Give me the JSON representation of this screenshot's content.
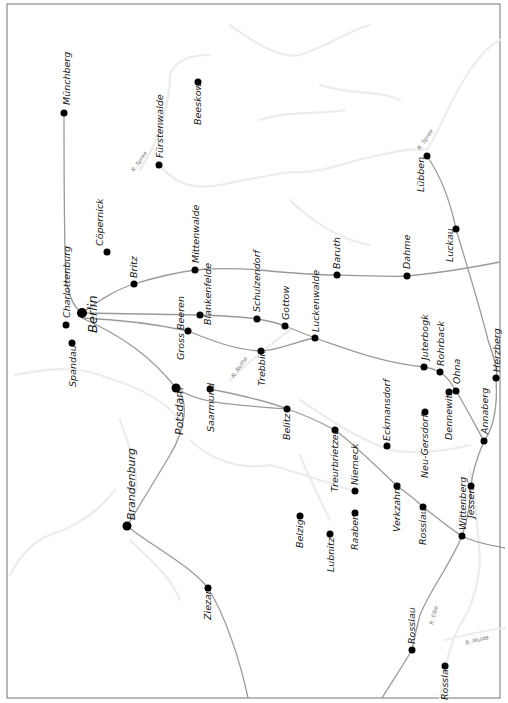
{
  "map": {
    "frame": {
      "x": 7,
      "y": 4,
      "w": 493,
      "h": 694
    },
    "colors": {
      "rail": "#9a9a9a",
      "town": "#000000",
      "river": "#ececec",
      "frame": "#8a8a8a",
      "label": "#1a1a1a"
    },
    "towns": [
      {
        "name": "Münchberg",
        "x": 64,
        "y": 113,
        "r": 3.5,
        "lx": 70,
        "ly": 105,
        "size": "normal"
      },
      {
        "name": "Beeskow",
        "x": 198,
        "y": 82,
        "r": 3.5,
        "lx": 201,
        "ly": 125,
        "size": "normal"
      },
      {
        "name": "Fürstenwalde",
        "x": 159,
        "y": 165,
        "r": 3.5,
        "lx": 163,
        "ly": 158,
        "size": "normal"
      },
      {
        "name": "Cöpernick",
        "x": 107,
        "y": 252,
        "r": 3.5,
        "lx": 103,
        "ly": 246,
        "size": "normal"
      },
      {
        "name": "Charlottenburg",
        "x": 66,
        "y": 325,
        "r": 3.5,
        "lx": 70,
        "ly": 318,
        "size": "normal"
      },
      {
        "name": "Spandau",
        "x": 72,
        "y": 343,
        "r": 3.5,
        "lx": 76,
        "ly": 387,
        "size": "normal"
      },
      {
        "name": "Berlin",
        "x": 82,
        "y": 313,
        "r": 5,
        "lx": 97,
        "ly": 333,
        "size": "big"
      },
      {
        "name": "Britz",
        "x": 134,
        "y": 284,
        "r": 3.5,
        "lx": 137,
        "ly": 278,
        "size": "normal"
      },
      {
        "name": "Mittenwalde",
        "x": 195,
        "y": 270,
        "r": 3.5,
        "lx": 199,
        "ly": 263,
        "size": "normal"
      },
      {
        "name": "Blankenfelde",
        "x": 200,
        "y": 315,
        "r": 3.5,
        "lx": 211,
        "ly": 325,
        "size": "normal"
      },
      {
        "name": "Gross Beeren",
        "x": 188,
        "y": 331,
        "r": 3.5,
        "lx": 184,
        "ly": 360,
        "size": "normal"
      },
      {
        "name": "Schulzendorf",
        "x": 257,
        "y": 319,
        "r": 3.5,
        "lx": 260,
        "ly": 312,
        "size": "normal"
      },
      {
        "name": "Gottow",
        "x": 285,
        "y": 326,
        "r": 3.5,
        "lx": 289,
        "ly": 320,
        "size": "normal"
      },
      {
        "name": "Luckenwalde",
        "x": 315,
        "y": 338,
        "r": 3.5,
        "lx": 319,
        "ly": 332,
        "size": "normal"
      },
      {
        "name": "Trebbin",
        "x": 261,
        "y": 351,
        "r": 3.5,
        "lx": 265,
        "ly": 386,
        "size": "normal"
      },
      {
        "name": "Baruth",
        "x": 337,
        "y": 275,
        "r": 3.5,
        "lx": 340,
        "ly": 269,
        "size": "normal"
      },
      {
        "name": "Dahme",
        "x": 407,
        "y": 276,
        "r": 3.5,
        "lx": 410,
        "ly": 269,
        "size": "normal"
      },
      {
        "name": "Lübben",
        "x": 427,
        "y": 156,
        "r": 3.5,
        "lx": 424,
        "ly": 192,
        "size": "normal"
      },
      {
        "name": "Luckau",
        "x": 456,
        "y": 229,
        "r": 3.5,
        "lx": 453,
        "ly": 262,
        "size": "normal"
      },
      {
        "name": "Potsdam",
        "x": 176,
        "y": 388,
        "r": 4.5,
        "lx": 183,
        "ly": 435,
        "size": "medium"
      },
      {
        "name": "Saarmund",
        "x": 210,
        "y": 389,
        "r": 3.5,
        "lx": 214,
        "ly": 432,
        "size": "normal"
      },
      {
        "name": "Belitz",
        "x": 287,
        "y": 409,
        "r": 3.5,
        "lx": 290,
        "ly": 440,
        "size": "normal"
      },
      {
        "name": "Juterbogk",
        "x": 424,
        "y": 367,
        "r": 3.5,
        "lx": 428,
        "ly": 360,
        "size": "normal"
      },
      {
        "name": "Rohrback",
        "x": 440,
        "y": 372,
        "r": 3.5,
        "lx": 444,
        "ly": 366,
        "size": "normal"
      },
      {
        "name": "Ohna",
        "x": 456,
        "y": 391,
        "r": 3.5,
        "lx": 460,
        "ly": 384,
        "size": "normal"
      },
      {
        "name": "Dennewitz",
        "x": 449,
        "y": 392,
        "r": 3.5,
        "lx": 452,
        "ly": 440,
        "size": "normal"
      },
      {
        "name": "Herzberg",
        "x": 496,
        "y": 378,
        "r": 3.5,
        "lx": 500,
        "ly": 372,
        "size": "normal"
      },
      {
        "name": "Neu-Gersdorf",
        "x": 425,
        "y": 412,
        "r": 3.5,
        "lx": 428,
        "ly": 478,
        "size": "normal"
      },
      {
        "name": "Eckmansdorf",
        "x": 387,
        "y": 446,
        "r": 3.5,
        "lx": 390,
        "ly": 441,
        "size": "normal"
      },
      {
        "name": "Annaberg",
        "x": 484,
        "y": 441,
        "r": 3.5,
        "lx": 488,
        "ly": 434,
        "size": "normal"
      },
      {
        "name": "Treurbrietzen",
        "x": 335,
        "y": 430,
        "r": 3.5,
        "lx": 338,
        "ly": 492,
        "size": "normal"
      },
      {
        "name": "Niemeck",
        "x": 355,
        "y": 491,
        "r": 3.5,
        "lx": 358,
        "ly": 485,
        "size": "normal"
      },
      {
        "name": "Jessen",
        "x": 471,
        "y": 486,
        "r": 3.5,
        "lx": 474,
        "ly": 518,
        "size": "normal"
      },
      {
        "name": "Verkzahna",
        "x": 397,
        "y": 486,
        "r": 3.5,
        "lx": 400,
        "ly": 532,
        "size": "normal"
      },
      {
        "name": "Rosslau",
        "x": 423,
        "y": 507,
        "r": 3.5,
        "lx": 426,
        "ly": 545,
        "size": "normal"
      },
      {
        "name": "Belzig",
        "x": 300,
        "y": 516,
        "r": 3.5,
        "lx": 303,
        "ly": 548,
        "size": "normal"
      },
      {
        "name": "Raaben",
        "x": 355,
        "y": 513,
        "r": 3.5,
        "lx": 358,
        "ly": 550,
        "size": "normal"
      },
      {
        "name": "Wittenberg",
        "x": 462,
        "y": 536,
        "r": 3.5,
        "lx": 466,
        "ly": 530,
        "size": "normal"
      },
      {
        "name": "Lubnitz",
        "x": 330,
        "y": 534,
        "r": 3.5,
        "lx": 334,
        "ly": 572,
        "size": "normal"
      },
      {
        "name": "Brandenburg",
        "x": 127,
        "y": 526,
        "r": 4.5,
        "lx": 135,
        "ly": 520,
        "size": "medium"
      },
      {
        "name": "Ziezar",
        "x": 208,
        "y": 588,
        "r": 3.5,
        "lx": 211,
        "ly": 620,
        "size": "normal"
      },
      {
        "name": "Rosslau",
        "x": 412,
        "y": 650,
        "r": 3.5,
        "lx": 415,
        "ly": 644,
        "size": "normal"
      },
      {
        "name": "Rosslau",
        "x": 445,
        "y": 666,
        "r": 3.5,
        "lx": 448,
        "ly": 700,
        "size": "normal"
      }
    ],
    "rivers": [
      {
        "name": "R. Spree",
        "x": 134,
        "y": 172,
        "angle": -55
      },
      {
        "name": "R. Spree",
        "x": 420,
        "y": 150,
        "angle": -55
      },
      {
        "name": "R. Nuthe",
        "x": 234,
        "y": 378,
        "angle": -55
      },
      {
        "name": "R. Elbe",
        "x": 433,
        "y": 625,
        "angle": -75
      },
      {
        "name": "R. Mulde",
        "x": 466,
        "y": 645,
        "angle": -15
      }
    ],
    "railways": [
      "M64,113 C64,180 64,240 66,280 C70,300 75,308 82,313",
      "M82,313 C100,300 115,290 134,284 C160,276 180,272 195,270 C215,268 235,268 260,270 C290,273 315,275 337,275 C365,276 390,277 407,276 C440,273 470,268 500,262",
      "M82,313 C120,314 160,314 200,315 C225,316 245,317 257,319 C270,321 278,323 285,326 C295,330 305,334 315,338",
      "M82,318 C130,320 160,325 188,331 C210,340 235,350 261,351 C280,350 300,340 315,338 C350,350 380,362 424,367 C432,368 436,370 440,372 C446,376 452,384 456,391 C465,405 475,425 484,441",
      "M82,318 C120,335 150,355 176,388",
      "M176,388 C190,400 185,430 170,455 C155,480 140,505 127,526",
      "M127,526 C150,545 190,565 208,588 C225,615 240,660 248,698",
      "M176,388 C200,405 240,405 287,409",
      "M210,389 C240,395 270,402 287,409 C305,415 320,422 335,430 C355,445 375,465 397,486 C410,495 418,502 423,507 C440,520 452,530 462,536 C475,543 490,545 505,548",
      "M427,156 C440,175 450,200 456,229 C465,260 478,300 488,340 C495,360 498,375 496,378 C498,410 492,430 484,441 C476,460 472,475 471,486 C470,510 466,525 462,536 C450,565 430,590 420,615 C416,630 414,640 412,650 C400,670 390,685 382,698"
    ],
    "river_paths": [
      "M140,170 C160,140 170,100 170,75 C175,60 190,55 210,55",
      "M160,165 C175,185 195,190 220,185 C245,180 270,175 290,172 C320,175 350,160 380,155 C400,150 415,148 427,150",
      "M427,150 C440,130 450,100 470,70 C480,55 490,45 500,40",
      "M230,25 C250,40 280,60 300,55 C330,45 350,30 370,25",
      "M320,85 C350,95 380,90 400,100",
      "M260,120 C290,110 320,115 345,110",
      "M290,200 C310,220 340,240 370,245",
      "M15,375 C40,370 70,365 100,375 C130,385 160,395 180,420",
      "M120,420 C130,450 140,470 135,495",
      "M115,490 C100,510 80,525 50,535 C35,540 20,555 10,575",
      "M130,540 C150,560 170,575 180,600",
      "M190,440 C210,460 240,470 270,465 C290,470 320,480 350,490",
      "M230,380 C250,360 270,345 290,330",
      "M300,400 C330,420 360,440 390,450 C420,455 450,450 470,445",
      "M470,470 C475,500 478,530 480,560 C478,590 470,610 460,625 C450,645 445,665 440,698",
      "M445,640 C465,635 485,630 505,628",
      "M300,455 C310,480 320,500 330,520"
    ]
  }
}
